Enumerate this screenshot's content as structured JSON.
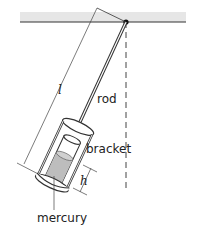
{
  "diagram": {
    "labels": {
      "length": "l",
      "rod": "rod",
      "bracket": "bracket",
      "height": "h",
      "mercury": "mercury"
    },
    "colors": {
      "ceiling": "#e6e6e6",
      "line": "#333333",
      "mercury": "#bdbdbd"
    }
  }
}
